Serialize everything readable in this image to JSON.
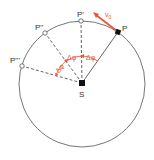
{
  "diagram": {
    "center_label": "S",
    "points": [
      {
        "id": "P",
        "label": "P",
        "style": "filled"
      },
      {
        "id": "P1",
        "label": "P'",
        "style": "hollow"
      },
      {
        "id": "P2",
        "label": "P''",
        "style": "hollow"
      },
      {
        "id": "P3",
        "label": "P'''",
        "style": "hollow"
      }
    ],
    "velocity_label": "v",
    "velocity_subscript": "0",
    "angle_labels": [
      "Δφ",
      "Δφ",
      "Δφ"
    ],
    "colors": {
      "accent": "#e8533a",
      "line": "#555555",
      "circle": "#666666"
    }
  }
}
